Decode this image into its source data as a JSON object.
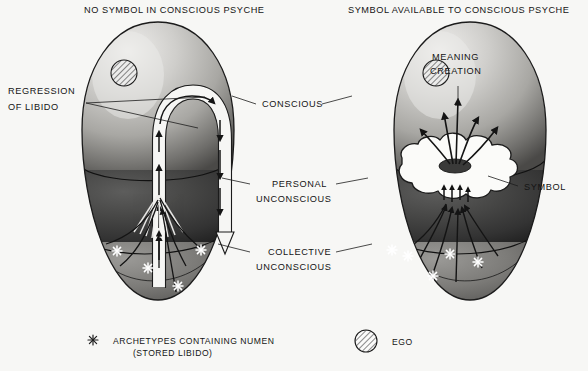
{
  "figure": {
    "background_color": "#f7f7f5",
    "ink_color": "#141414"
  },
  "titles": {
    "left": "NO SYMBOL IN CONSCIOUS PSYCHE",
    "right": "SYMBOL AVAILABLE TO CONSCIOUS PSYCHE"
  },
  "left_labels": {
    "regression_line1": "REGRESSION",
    "regression_line2": "OF LIBIDO"
  },
  "center_labels": {
    "conscious": "CONSCIOUS",
    "personal_line1": "PERSONAL",
    "personal_line2": "UNCONSCIOUS",
    "collective_line1": "COLLECTIVE",
    "collective_line2": "UNCONSCIOUS"
  },
  "right_labels": {
    "symbol": "SYMBOL",
    "meaning_line1": "MEANING",
    "meaning_line2": "CREATION"
  },
  "legend": {
    "archetype": {
      "icon": "asterisk-star-icon",
      "line1": "ARCHETYPES CONTAINING NUMEN",
      "line2": "(STORED LIBIDO)"
    },
    "ego": {
      "icon": "hatched-circle-icon",
      "label": "EGO"
    }
  },
  "zones": {
    "conscious_fill": "#b9b9b6",
    "personal_unconscious_fill": "#3c3c3c",
    "collective_unconscious_fill": "#6e6e6b",
    "highlight": "#e8e8e6",
    "shadow": "#2a2a2a"
  },
  "diagram_meta": {
    "type": "conceptual-diagram",
    "panels": 2,
    "archetype_count_left": 4,
    "archetype_count_right": 5,
    "ego_count": 2
  }
}
